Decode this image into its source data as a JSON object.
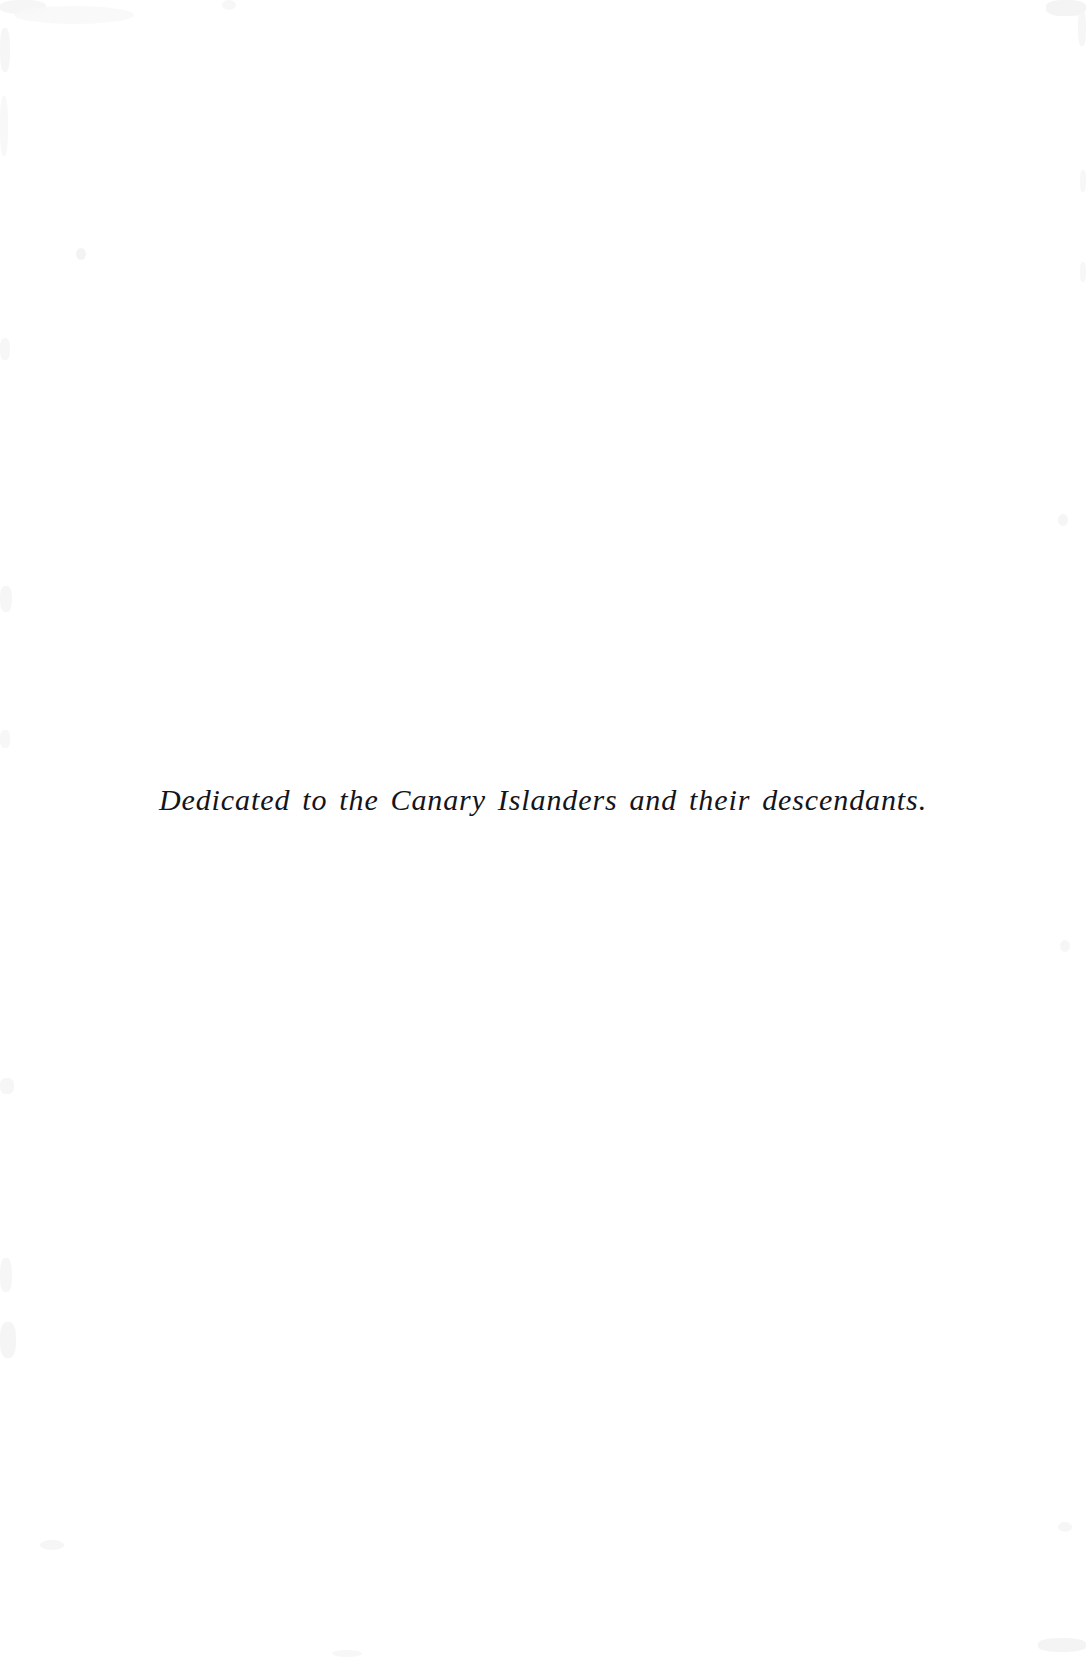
{
  "page": {
    "kind": "book-dedication-page",
    "background_color": "#ffffff",
    "width": 1086,
    "height": 1657
  },
  "dedication": {
    "text": "Dedicated to the Canary Islanders and their descendants.",
    "color": "#14151a",
    "alignment": "center"
  },
  "artifacts": {
    "description": "faint grey scan noise along page edges",
    "color": "#f4f4f5"
  }
}
